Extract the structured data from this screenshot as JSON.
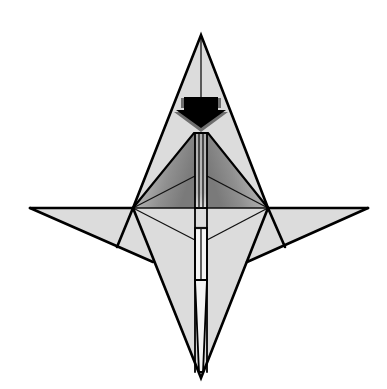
{
  "diagram": {
    "type": "origami-step",
    "colors": {
      "paper": "#dcdcdc",
      "shade_dark": "#8a8a8a",
      "line": "#000000",
      "arrow": "#000000",
      "arrow_shadow": "#6e6e6e",
      "strip": "#f4f4f4",
      "background": "#ffffff"
    },
    "vertices": {
      "top": [
        201,
        35
      ],
      "bottom": [
        201,
        378
      ],
      "left_tip": [
        30,
        208
      ],
      "right_tip": [
        368,
        208
      ],
      "left_joint": [
        133,
        208
      ],
      "right_joint": [
        268,
        208
      ],
      "left_lower": [
        153,
        262
      ],
      "right_lower": [
        247,
        262
      ],
      "center_top": [
        201,
        133
      ]
    },
    "arrow": {
      "kind": "push / fold-down arrow",
      "direction": "down",
      "position": [
        201,
        112
      ]
    }
  }
}
